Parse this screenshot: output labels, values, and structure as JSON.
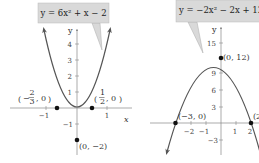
{
  "graphs": [
    {
      "equation": "y = 6x² + x − 2",
      "y_axis_label": "y",
      "x_axis_label": "x",
      "y_ticks": [
        "4",
        "3",
        "2",
        "1",
        "−1"
      ],
      "x_ticks": [
        "−1",
        "1"
      ],
      "points": [
        {
          "label": "(−2/3, 0)",
          "x": -0.6667,
          "y": 0
        },
        {
          "label": "(1/2, 0)",
          "x": 0.5,
          "y": 0
        },
        {
          "label": "(0, −2)",
          "x": 0,
          "y": -2
        }
      ],
      "point_labels": {
        "left_root_num": "2",
        "left_root_den": "3",
        "right_root_num": "1",
        "right_root_den": "2",
        "vertex": "(0, −2)"
      }
    },
    {
      "equation": "y = −2x² − 2x + 12",
      "y_axis_label": "y",
      "y_ticks": [
        "15",
        "9",
        "6",
        "3",
        "−3"
      ],
      "x_ticks": [
        "−2",
        "−1",
        "1",
        "2"
      ],
      "points": [
        {
          "label": "(0, 12)",
          "x": 0,
          "y": 12
        },
        {
          "label": "(−3, 0)",
          "x": -3,
          "y": 0
        },
        {
          "label": "(2, 0)",
          "x": 2,
          "y": 0
        }
      ],
      "point_labels": {
        "y_intercept": "(0, 12)",
        "left_root": "(−3, 0)",
        "right_root_partial": "(2"
      }
    }
  ],
  "colors": {
    "curve": "#555555",
    "callout_fill": "#d9d9d9",
    "axis": "#777777",
    "point": "#111111"
  }
}
